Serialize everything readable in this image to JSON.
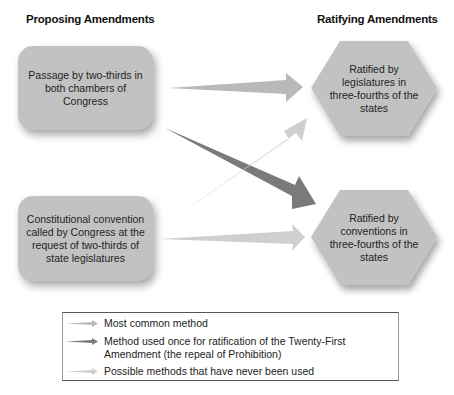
{
  "headings": {
    "proposing": "Proposing Amendments",
    "ratifying": "Ratifying Amendments"
  },
  "proposing_methods": [
    {
      "label": "Passage by two-thirds in both chambers of Congress"
    },
    {
      "label": "Constitutional convention called by Congress at the request of two-thirds of state legislatures"
    }
  ],
  "ratifying_methods": [
    {
      "label": "Ratified by legislatures in three-fourths of the states"
    },
    {
      "label": "Ratified by conventions in three-fourths of the states"
    }
  ],
  "arrows": [
    {
      "from": "Passage by two-thirds in both chambers of Congress",
      "to": "Ratified by legislatures in three-fourths of the states",
      "type": "most_common"
    },
    {
      "from": "Passage by two-thirds in both chambers of Congress",
      "to": "Ratified by conventions in three-fourths of the states",
      "type": "used_once"
    },
    {
      "from": "Constitutional convention called by Congress at the request of two-thirds of state legislatures",
      "to": "Ratified by legislatures in three-fourths of the states",
      "type": "never_used"
    },
    {
      "from": "Constitutional convention called by Congress at the request of two-thirds of state legislatures",
      "to": "Ratified by conventions in three-fourths of the states",
      "type": "never_used"
    }
  ],
  "legend": {
    "items": [
      {
        "type": "most_common",
        "label": "Most common method"
      },
      {
        "type": "used_once",
        "label": "Method used once for ratification of the Twenty-First Amendment (the repeal of Prohibition)"
      },
      {
        "type": "never_used",
        "label": "Possible methods that have never been used"
      }
    ]
  },
  "colors": {
    "box_fill": "#c2c2c2",
    "most_common": "#b9b9b9",
    "used_once": "#7a7a7a",
    "never_used": "#cfcfcf"
  }
}
